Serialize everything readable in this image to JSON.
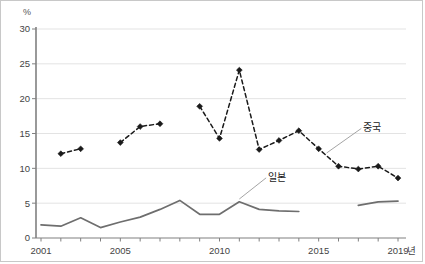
{
  "chart_data": {
    "type": "line",
    "title": "",
    "xlabel": "년",
    "ylabel": "%",
    "ylim": [
      0,
      30
    ],
    "xlim": [
      2001,
      2019
    ],
    "yticks": [
      0,
      5,
      10,
      15,
      20,
      25,
      30
    ],
    "xticks_labeled": [
      2001,
      2005,
      2010,
      2015,
      2019
    ],
    "grid": "horizontal",
    "legend": "inline-annotation",
    "series": [
      {
        "name": "중국",
        "style": "dashed-with-diamond-markers",
        "color": "#1a1a1a",
        "points": [
          {
            "x": 2002,
            "y": 12.1
          },
          {
            "x": 2003,
            "y": 12.8
          },
          {
            "x": 2005,
            "y": 13.7
          },
          {
            "x": 2006,
            "y": 16.0
          },
          {
            "x": 2007,
            "y": 16.4
          },
          {
            "x": 2009,
            "y": 18.9
          },
          {
            "x": 2010,
            "y": 14.3
          },
          {
            "x": 2011,
            "y": 24.1
          },
          {
            "x": 2012,
            "y": 12.7
          },
          {
            "x": 2013,
            "y": 14.0
          },
          {
            "x": 2014,
            "y": 15.4
          },
          {
            "x": 2015,
            "y": 12.8
          },
          {
            "x": 2016,
            "y": 10.3
          },
          {
            "x": 2017,
            "y": 9.9
          },
          {
            "x": 2018,
            "y": 10.3
          },
          {
            "x": 2019,
            "y": 8.6
          }
        ],
        "segments": [
          [
            2002,
            2003
          ],
          [
            2005,
            2007
          ],
          [
            2009,
            2019
          ]
        ]
      },
      {
        "name": "일본",
        "style": "solid-line",
        "color": "#6e6e6e",
        "points": [
          {
            "x": 2001,
            "y": 1.9
          },
          {
            "x": 2002,
            "y": 1.7
          },
          {
            "x": 2003,
            "y": 2.9
          },
          {
            "x": 2004,
            "y": 1.5
          },
          {
            "x": 2005,
            "y": 2.3
          },
          {
            "x": 2006,
            "y": 3.0
          },
          {
            "x": 2007,
            "y": 4.1
          },
          {
            "x": 2008,
            "y": 5.4
          },
          {
            "x": 2009,
            "y": 3.4
          },
          {
            "x": 2010,
            "y": 3.4
          },
          {
            "x": 2011,
            "y": 5.2
          },
          {
            "x": 2012,
            "y": 4.1
          },
          {
            "x": 2013,
            "y": 3.9
          },
          {
            "x": 2014,
            "y": 3.8
          },
          {
            "x": 2017,
            "y": 4.7
          },
          {
            "x": 2018,
            "y": 5.2
          },
          {
            "x": 2019,
            "y": 5.3
          }
        ],
        "segments": [
          [
            2001,
            2014
          ],
          [
            2017,
            2019
          ]
        ]
      }
    ],
    "annotations": [
      {
        "text": "중국",
        "x": 2017.1,
        "y": 15.3,
        "leader_to": {
          "x": 2015.4,
          "y": 12.2
        }
      },
      {
        "text": "일본",
        "x": 2012.3,
        "y": 8.2,
        "leader_to": {
          "x": 2011.0,
          "y": 5.6
        }
      }
    ]
  },
  "axis": {
    "unit_y": "%",
    "unit_x": "년",
    "ytick_labels": [
      "30",
      "25",
      "20",
      "15",
      "10",
      "5",
      "0"
    ],
    "xtick_labels": [
      "2001",
      "2005",
      "2010",
      "2015",
      "2019"
    ]
  },
  "colors": {
    "china": "#1a1a1a",
    "japan": "#6e6e6e",
    "grid": "#e3e3e3",
    "axis": "#808080",
    "text": "#444444",
    "border": "#c8c8c8"
  }
}
